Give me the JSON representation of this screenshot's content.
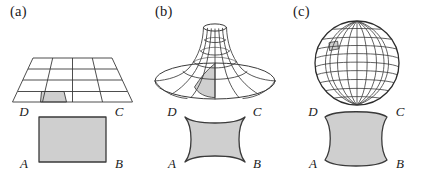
{
  "figure": {
    "background_color": "#ffffff",
    "line_color": "#3a3a3a",
    "fill_color": "#cfcfcf",
    "label_color": "#1a1a1a"
  },
  "panels": [
    {
      "id": "a",
      "label": "(a)",
      "surface": {
        "name": "flat-plane-grid",
        "type": "plane",
        "curvature": "zero",
        "grid_rows": 4,
        "grid_cols": 4,
        "highlighted_cell": {
          "row": 4,
          "col": 2
        }
      },
      "quadrilateral": {
        "name": "flat-square",
        "side_curvature": "straight",
        "vertices": {
          "a": "A",
          "b": "B",
          "c": "C",
          "d": "D"
        }
      }
    },
    {
      "id": "b",
      "label": "(b)",
      "surface": {
        "name": "pseudosphere",
        "type": "pseudosphere",
        "curvature": "negative",
        "meridians": 8,
        "parallels": 5,
        "highlighted_cell": {
          "row": 1,
          "col": 4
        }
      },
      "quadrilateral": {
        "name": "concave-square",
        "side_curvature": "concave",
        "vertices": {
          "a": "A",
          "b": "B",
          "c": "C",
          "d": "D"
        }
      }
    },
    {
      "id": "c",
      "label": "(c)",
      "surface": {
        "name": "sphere",
        "type": "sphere",
        "curvature": "positive",
        "meridians": 12,
        "parallels": 10,
        "highlighted_cell": {
          "row": 2,
          "col": 3
        }
      },
      "quadrilateral": {
        "name": "convex-square",
        "side_curvature": "convex",
        "vertices": {
          "a": "A",
          "b": "B",
          "c": "C",
          "d": "D"
        }
      }
    }
  ]
}
